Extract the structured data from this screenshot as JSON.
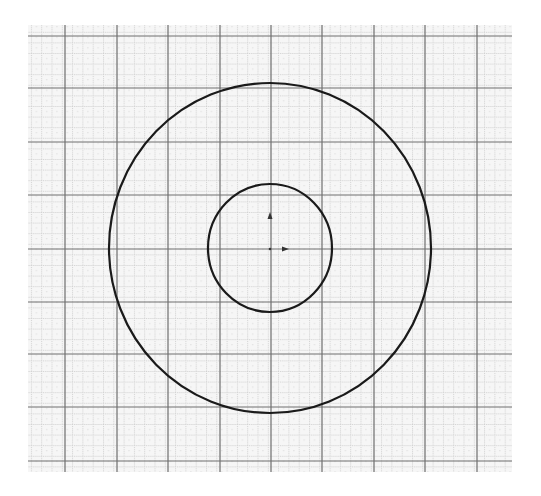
{
  "canvas": {
    "width": 541,
    "height": 496,
    "background": "#ffffff"
  },
  "grid": {
    "left": 28,
    "top": 25,
    "right": 512,
    "bottom": 472,
    "fill": "#f4f4f4",
    "minor_color": "#c8c8c8",
    "minor_step": 10.3,
    "major_color": "#6e6e6e",
    "major_x": [
      65,
      117,
      168,
      220,
      271,
      322,
      374,
      425,
      477
    ],
    "major_y": [
      36,
      88,
      142,
      195,
      249,
      302,
      354,
      407,
      461
    ]
  },
  "shapes": {
    "outer_circle": {
      "cx": 270,
      "cy": 248,
      "rx": 161,
      "ry": 165,
      "stroke": "#1a1a1a",
      "stroke_width": 2.2
    },
    "inner_circle": {
      "cx": 270,
      "cy": 248,
      "rx": 62,
      "ry": 64,
      "stroke": "#1a1a1a",
      "stroke_width": 2.2
    }
  },
  "origin": {
    "x": 270,
    "y": 249,
    "color": "#333333",
    "y_axis_arrow": {
      "tip_x": 270,
      "tip_y": 212
    },
    "x_axis_arrow": {
      "tip_x": 289,
      "tip_y": 249
    }
  }
}
